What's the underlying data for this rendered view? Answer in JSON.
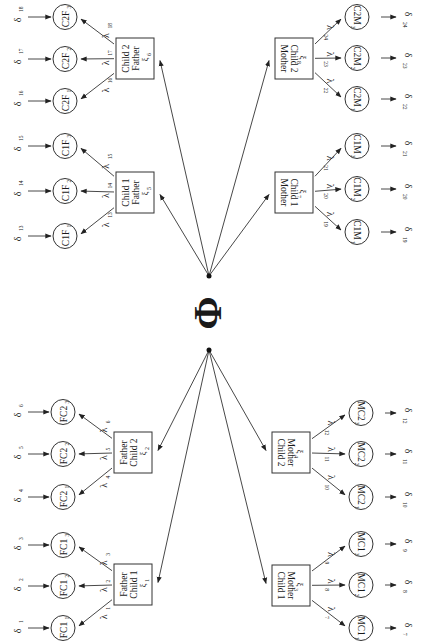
{
  "diagram": {
    "center_symbol": "Φ",
    "hubs": {
      "top": [
        209,
        276
      ],
      "bottom": [
        209,
        350
      ]
    },
    "factors": [
      {
        "id": "f1",
        "lines": [
          "Father",
          "Child 1",
          "ξ",
          "1"
        ],
        "x": 114,
        "y": 564,
        "w": 38,
        "h": 41,
        "side": "left",
        "hub": "bottom"
      },
      {
        "id": "f2",
        "lines": [
          "Father",
          "Child 2",
          "ξ",
          "2"
        ],
        "x": 114,
        "y": 432,
        "w": 38,
        "h": 41,
        "side": "left",
        "hub": "bottom"
      },
      {
        "id": "f3",
        "lines": [
          "ξ",
          "3",
          "Mother",
          "Child 1"
        ],
        "x": 272,
        "y": 565,
        "w": 38,
        "h": 41,
        "side": "right",
        "hub": "bottom"
      },
      {
        "id": "f4",
        "lines": [
          "ξ",
          "4",
          "Mother",
          "Child 2"
        ],
        "x": 272,
        "y": 432,
        "w": 38,
        "h": 41,
        "side": "right",
        "hub": "bottom"
      },
      {
        "id": "f5",
        "lines": [
          "Child 1",
          "Father",
          "ξ",
          "5"
        ],
        "x": 116,
        "y": 172,
        "w": 38,
        "h": 41,
        "side": "left",
        "hub": "top"
      },
      {
        "id": "f6",
        "lines": [
          "Child 2",
          "Father",
          "ξ",
          "6"
        ],
        "x": 116,
        "y": 38,
        "w": 38,
        "h": 41,
        "side": "left",
        "hub": "top"
      },
      {
        "id": "f7",
        "lines": [
          "ξ",
          "7",
          "Child 1",
          "Mother"
        ],
        "x": 275,
        "y": 172,
        "w": 38,
        "h": 41,
        "side": "right",
        "hub": "top"
      },
      {
        "id": "f8",
        "lines": [
          "ξ",
          "8",
          "Child 2",
          "Mother"
        ],
        "x": 275,
        "y": 38,
        "w": 38,
        "h": 41,
        "side": "right",
        "hub": "top"
      }
    ],
    "indicators": [
      {
        "label": "FC1",
        "sub": "1",
        "cx": 63,
        "cy": 628,
        "factor": "f1",
        "lambda": "1",
        "delta": "1"
      },
      {
        "label": "FC1",
        "sub": "2",
        "cx": 63,
        "cy": 586,
        "factor": "f1",
        "lambda": "2",
        "delta": "2"
      },
      {
        "label": "FC1",
        "sub": "3",
        "cx": 63,
        "cy": 545,
        "factor": "f1",
        "lambda": "3",
        "delta": "3"
      },
      {
        "label": "FC2",
        "sub": "1",
        "cx": 63,
        "cy": 497,
        "factor": "f2",
        "lambda": "4",
        "delta": "4"
      },
      {
        "label": "FC2",
        "sub": "2",
        "cx": 63,
        "cy": 454,
        "factor": "f2",
        "lambda": "5",
        "delta": "5"
      },
      {
        "label": "FC2",
        "sub": "3",
        "cx": 63,
        "cy": 412,
        "factor": "f2",
        "lambda": "6",
        "delta": "6"
      },
      {
        "label": "MC1",
        "sub": "1",
        "cx": 361,
        "cy": 628,
        "factor": "f3",
        "lambda": "7",
        "delta": "7"
      },
      {
        "label": "MC1",
        "sub": "2",
        "cx": 361,
        "cy": 585,
        "factor": "f3",
        "lambda": "8",
        "delta": "8"
      },
      {
        "label": "MC1",
        "sub": "3",
        "cx": 361,
        "cy": 544,
        "factor": "f3",
        "lambda": "9",
        "delta": "9"
      },
      {
        "label": "MC2",
        "sub": "1",
        "cx": 361,
        "cy": 497,
        "factor": "f4",
        "lambda": "10",
        "delta": "10"
      },
      {
        "label": "MC2",
        "sub": "2",
        "cx": 361,
        "cy": 454,
        "factor": "f4",
        "lambda": "11",
        "delta": "11"
      },
      {
        "label": "MC2",
        "sub": "3",
        "cx": 361,
        "cy": 413,
        "factor": "f4",
        "lambda": "12",
        "delta": "12"
      },
      {
        "label": "C1F",
        "sub": "1",
        "cx": 65,
        "cy": 236,
        "factor": "f5",
        "lambda": "13",
        "delta": "13"
      },
      {
        "label": "C1F",
        "sub": "2",
        "cx": 65,
        "cy": 191,
        "factor": "f5",
        "lambda": "14",
        "delta": "14"
      },
      {
        "label": "C1F",
        "sub": "3",
        "cx": 65,
        "cy": 146,
        "factor": "f5",
        "lambda": "15",
        "delta": "15"
      },
      {
        "label": "C2F",
        "sub": "1",
        "cx": 65,
        "cy": 101,
        "factor": "f6",
        "lambda": "16",
        "delta": "16"
      },
      {
        "label": "C2F",
        "sub": "2",
        "cx": 65,
        "cy": 59,
        "factor": "f6",
        "lambda": "17",
        "delta": "17"
      },
      {
        "label": "C2F",
        "sub": "3",
        "cx": 65,
        "cy": 17,
        "factor": "f6",
        "lambda": "18",
        "delta": "18"
      },
      {
        "label": "C1M",
        "sub": "1",
        "cx": 357,
        "cy": 232,
        "factor": "f7",
        "lambda": "19",
        "delta": "19"
      },
      {
        "label": "C1M",
        "sub": "2",
        "cx": 357,
        "cy": 189,
        "factor": "f7",
        "lambda": "20",
        "delta": "20"
      },
      {
        "label": "C1M",
        "sub": "3",
        "cx": 357,
        "cy": 146,
        "factor": "f7",
        "lambda": "21",
        "delta": "21"
      },
      {
        "label": "C2M",
        "sub": "1",
        "cx": 357,
        "cy": 99,
        "factor": "f8",
        "lambda": "22",
        "delta": "22"
      },
      {
        "label": "C2M",
        "sub": "2",
        "cx": 357,
        "cy": 58,
        "factor": "f8",
        "lambda": "23",
        "delta": "23"
      },
      {
        "label": "C2M",
        "sub": "3",
        "cx": 357,
        "cy": 17,
        "factor": "f8",
        "lambda": "24",
        "delta": "24"
      }
    ],
    "symbols": {
      "lambda": "λ",
      "delta": "δ"
    }
  }
}
